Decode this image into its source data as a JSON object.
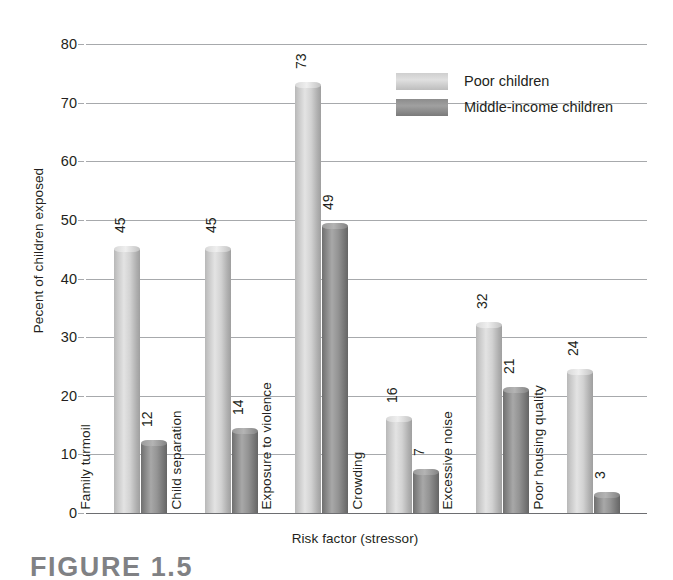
{
  "caption": "FIGURE 1.5",
  "legend": {
    "position": "top-right",
    "entries": [
      {
        "label": "Poor children",
        "swatch": "light"
      },
      {
        "label": "Middle-income children",
        "swatch": "dark"
      }
    ]
  },
  "colors": {
    "series_poor": "#cfcfcf",
    "series_middle": "#8c8c8c",
    "gridline": "#a7a9ac",
    "axis": "#6d6e71",
    "text": "#231f20",
    "caption": "#808184"
  },
  "chart_data": {
    "type": "bar",
    "title": "",
    "xlabel": "Risk factor (stressor)",
    "ylabel": "Pecent of children exposed",
    "categories": [
      "Family turmoil",
      "Child separation",
      "Exposure to violence",
      "Crowding",
      "Excessive noise",
      "Poor housing quality"
    ],
    "series": [
      {
        "name": "Poor children",
        "values": [
          45,
          45,
          73,
          16,
          32,
          24
        ]
      },
      {
        "name": "Middle-income children",
        "values": [
          12,
          14,
          49,
          7,
          21,
          3
        ]
      }
    ],
    "ylim": [
      0,
      80
    ],
    "yticks": [
      0,
      10,
      20,
      30,
      40,
      50,
      60,
      70,
      80
    ],
    "ytick_labels": [
      "0",
      "10",
      "20",
      "30",
      "40",
      "50",
      "60",
      "70",
      "80"
    ],
    "grid": true,
    "legend_position": "upper right",
    "value_labels": true,
    "value_label_rotation": 90,
    "category_label_rotation": 90
  }
}
